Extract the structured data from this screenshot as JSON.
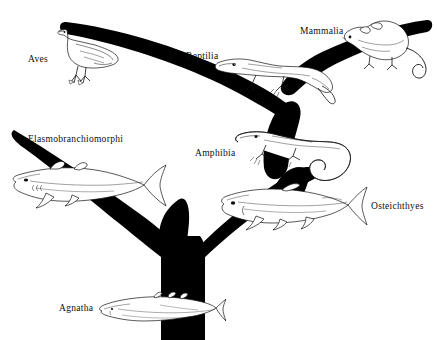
{
  "figure": {
    "kind": "phylogenetic-tree",
    "background_color": "#ffffff",
    "ink_color": "#000000",
    "width": 437,
    "height": 340
  },
  "taxa": [
    {
      "id": "aves",
      "label": "Aves",
      "x": 28,
      "y": 55,
      "organism": "bird-illustration"
    },
    {
      "id": "reptilia",
      "label": "Reptilia",
      "x": 186,
      "y": 52,
      "organism": "lizard-illustration"
    },
    {
      "id": "mammalia",
      "label": "Mammalia",
      "x": 300,
      "y": 27,
      "organism": "opossum-illustration"
    },
    {
      "id": "elasmobranchiomorphi",
      "label": "Elasmobranchiomorphi",
      "x": 28,
      "y": 135,
      "organism": "shark-illustration"
    },
    {
      "id": "amphibia",
      "label": "Amphibia",
      "x": 195,
      "y": 149,
      "organism": "salamander-illustration"
    },
    {
      "id": "osteichthyes",
      "label": "Osteichthyes",
      "x": 371,
      "y": 202,
      "organism": "bony-fish-illustration"
    },
    {
      "id": "agnatha",
      "label": "Agnatha",
      "x": 59,
      "y": 304,
      "organism": "jawless-fish-illustration"
    }
  ],
  "branches": [
    {
      "id": "trunk",
      "from": "root",
      "to": "first-fork",
      "description": "thick vertical trunk rising from bottom center"
    },
    {
      "id": "branch-left",
      "from": "first-fork",
      "to": "elasmobranchiomorphi",
      "description": "left fork curving up-left to cartilaginous fishes"
    },
    {
      "id": "branch-right",
      "from": "first-fork",
      "to": "osteichthyes",
      "description": "right fork curving up-right to bony fishes"
    },
    {
      "id": "branch-tetrapod",
      "from": "osteichthyes",
      "to": "amphibia",
      "description": "stem from bony fishes up to amphibians"
    },
    {
      "id": "branch-amniote",
      "from": "amphibia",
      "to": "reptilia",
      "description": "stem from amphibians up to reptiles"
    },
    {
      "id": "branch-aves",
      "from": "reptilia",
      "to": "aves",
      "description": "arching branch left to birds"
    },
    {
      "id": "branch-mammalia",
      "from": "reptilia",
      "to": "mammalia",
      "description": "arching branch right to mammals"
    }
  ]
}
